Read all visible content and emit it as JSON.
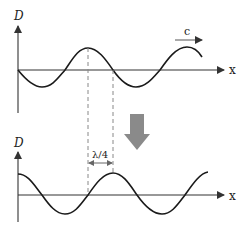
{
  "diagram": {
    "top_plot": {
      "y_axis_label": "D",
      "x_axis_label": "x",
      "velocity_label": "c"
    },
    "bottom_plot": {
      "y_axis_label": "D",
      "x_axis_label": "x",
      "shift_label": "λ/4"
    },
    "colors": {
      "curve": "#1a1a1a",
      "axis": "#333333",
      "dashed": "#888888",
      "transition_arrow": "#8a8a8a"
    }
  }
}
